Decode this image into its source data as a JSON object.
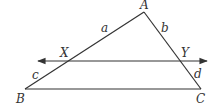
{
  "diagram": {
    "type": "geometry-triangle-with-parallel-line",
    "points": {
      "A": {
        "label": "A",
        "x": 144,
        "y": 12
      },
      "B": {
        "label": "B",
        "x": 25,
        "y": 89
      },
      "C": {
        "label": "C",
        "x": 201,
        "y": 89
      },
      "X": {
        "label": "X",
        "x": 68,
        "y": 61
      },
      "Y": {
        "label": "Y",
        "x": 180,
        "y": 61
      }
    },
    "segment_labels": {
      "a": "a",
      "b": "b",
      "c": "c",
      "d": "d"
    },
    "line_color": "#333333"
  }
}
